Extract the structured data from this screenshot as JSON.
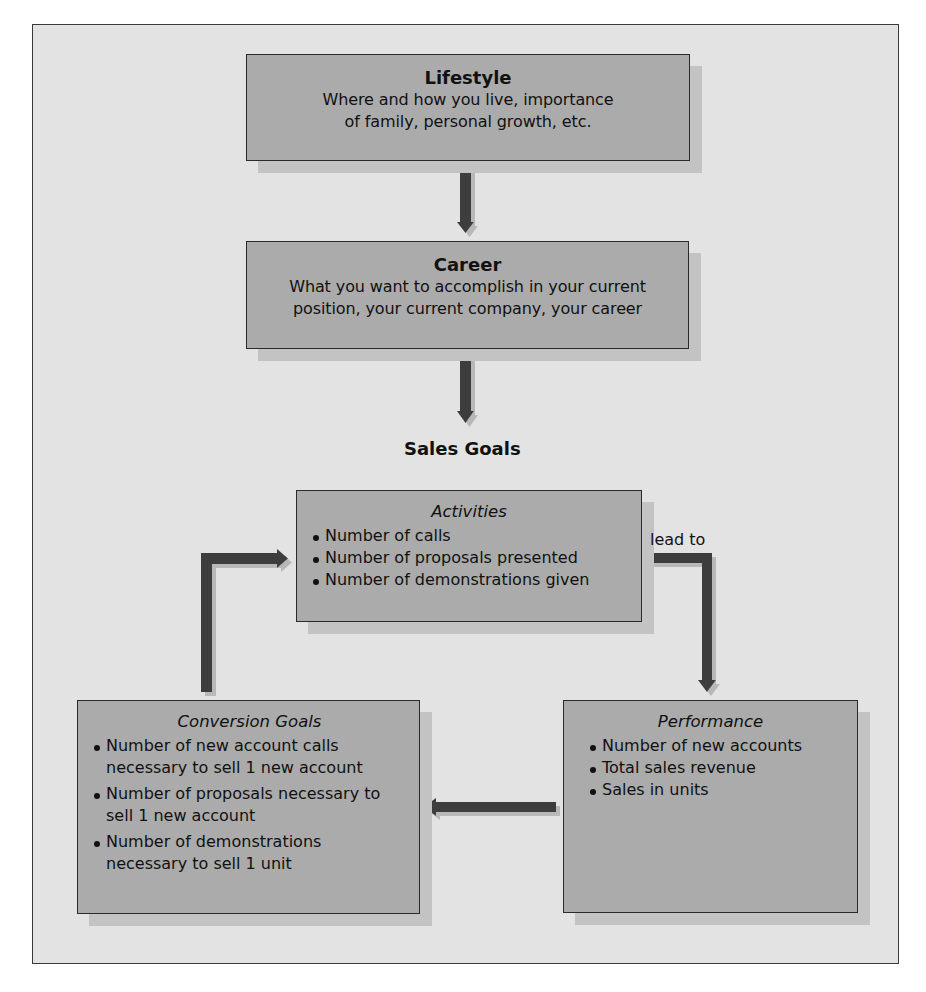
{
  "diagram": {
    "lifestyle": {
      "title": "Lifestyle",
      "lines": [
        "Where and how you live, importance",
        "of family, personal growth, etc."
      ]
    },
    "career": {
      "title": "Career",
      "lines": [
        "What you want to accomplish in your current",
        "position, your current company, your career"
      ]
    },
    "sales_goals_label": "Sales Goals",
    "activities": {
      "title": "Activities",
      "items": [
        "Number of calls",
        "Number of proposals presented",
        "Number of demonstrations given"
      ]
    },
    "lead_to_label": "lead to",
    "performance": {
      "title": "Performance",
      "items": [
        "Number of new accounts",
        "Total sales revenue",
        "Sales in units"
      ]
    },
    "conversion_goals": {
      "title": "Conversion Goals",
      "items": [
        "Number of new account calls necessary to sell 1 new account",
        "Number of proposals necessary to sell 1 new account",
        "Number of demonstrations necessary to sell 1 unit"
      ]
    },
    "flows": [
      {
        "from": "Lifestyle",
        "to": "Career"
      },
      {
        "from": "Career",
        "to": "Sales Goals"
      },
      {
        "from": "Activities",
        "to": "Performance",
        "label": "lead to"
      },
      {
        "from": "Performance",
        "to": "Conversion Goals"
      },
      {
        "from": "Conversion Goals",
        "to": "Activities"
      }
    ],
    "colors": {
      "background": "#e3e3e3",
      "box_fill": "#ababab",
      "box_shadow": "#c3c3c3",
      "arrow": "#3c3c3c",
      "border": "#2a2a2a"
    }
  }
}
